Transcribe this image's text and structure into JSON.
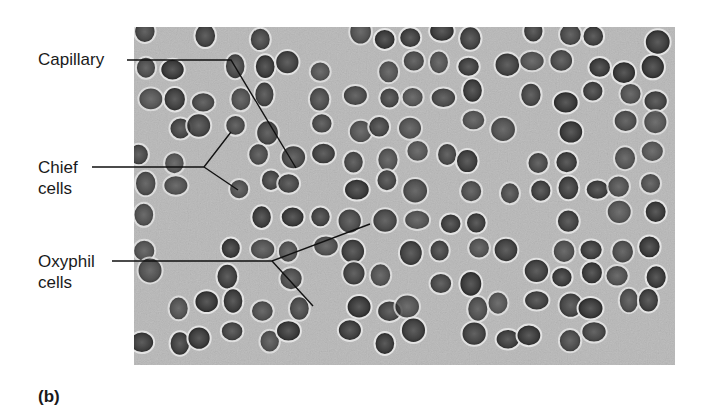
{
  "figure": {
    "panel_label": "(b)",
    "image": {
      "description": "Light micrograph of parathyroid gland tissue showing densely packed round nuclei",
      "colors": {
        "background": "#b9b9b9",
        "nucleus": "#3c3c3c",
        "nucleus_rim": "#222222"
      }
    },
    "labels": [
      {
        "id": "capillary",
        "lines": [
          "Capillary"
        ]
      },
      {
        "id": "chief-cells",
        "lines": [
          "Chief",
          "cells"
        ]
      },
      {
        "id": "oxyphil-cells",
        "lines": [
          "Oxyphil",
          "cells"
        ]
      }
    ]
  }
}
